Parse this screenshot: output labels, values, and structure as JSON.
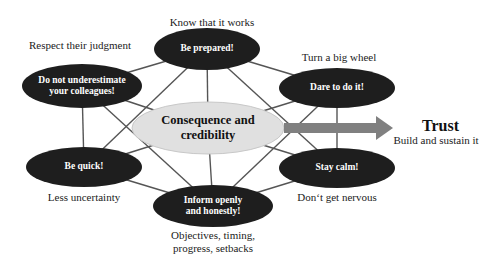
{
  "diagram": {
    "center": {
      "label_line1": "Consequence and",
      "label_line2": "credibility",
      "fill": "#e0e0e0"
    },
    "outcome": {
      "title": "Trust",
      "subtitle": "Build and sustain it",
      "arrow_color": "#808080"
    },
    "node_fill": "#1e1e1e",
    "edge_color": "#555555",
    "nodes": [
      {
        "id": "be-prepared",
        "label_line1": "Be prepared!",
        "label_line2": "",
        "caption": "Know that it works"
      },
      {
        "id": "do-not-underestimate",
        "label_line1": "Do not underestimate",
        "label_line2": "your colleagues!",
        "caption": "Respect their judgment"
      },
      {
        "id": "dare-to-do-it",
        "label_line1": "Dare to do it!",
        "label_line2": "",
        "caption": "Turn a big wheel"
      },
      {
        "id": "be-quick",
        "label_line1": "Be quick!",
        "label_line2": "",
        "caption": "Less uncertainty"
      },
      {
        "id": "stay-calm",
        "label_line1": "Stay calm!",
        "label_line2": "",
        "caption": "Don‘t get nervous"
      },
      {
        "id": "inform-openly",
        "label_line1": "Inform openly",
        "label_line2": "and honestly!",
        "caption_line1": "Objectives, timing,",
        "caption_line2": "progress, setbacks"
      }
    ]
  }
}
